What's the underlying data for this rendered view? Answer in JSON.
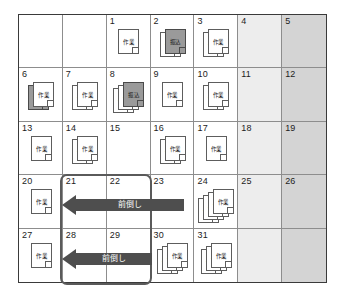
{
  "calendar": {
    "columns": 7,
    "rows": 5,
    "weekend_colors": {
      "saturday": "#ededed",
      "sunday": "#d4d4d4"
    },
    "icon_labels": {
      "work": "作業",
      "transfer": "振込"
    },
    "cells": [
      {
        "day": "",
        "shade": "blank",
        "icons": []
      },
      {
        "day": "",
        "shade": "blank",
        "icons": []
      },
      {
        "day": "1",
        "shade": "none",
        "icons": [
          "work"
        ]
      },
      {
        "day": "2",
        "shade": "none",
        "icons": [
          "work",
          "transfer"
        ]
      },
      {
        "day": "3",
        "shade": "none",
        "icons": [
          "work",
          "work"
        ]
      },
      {
        "day": "4",
        "shade": "sat",
        "icons": []
      },
      {
        "day": "5",
        "shade": "sun",
        "icons": []
      },
      {
        "day": "6",
        "shade": "none",
        "icons": [
          "transfer",
          "work"
        ]
      },
      {
        "day": "7",
        "shade": "none",
        "icons": [
          "work",
          "work"
        ]
      },
      {
        "day": "8",
        "shade": "none",
        "icons": [
          "work",
          "work",
          "transfer"
        ]
      },
      {
        "day": "9",
        "shade": "none",
        "icons": [
          "work"
        ]
      },
      {
        "day": "10",
        "shade": "none",
        "icons": [
          "work",
          "work"
        ]
      },
      {
        "day": "11",
        "shade": "sat",
        "icons": []
      },
      {
        "day": "12",
        "shade": "sun",
        "icons": []
      },
      {
        "day": "13",
        "shade": "none",
        "icons": [
          "work"
        ]
      },
      {
        "day": "14",
        "shade": "none",
        "icons": [
          "work",
          "work"
        ]
      },
      {
        "day": "15",
        "shade": "none",
        "icons": []
      },
      {
        "day": "16",
        "shade": "none",
        "icons": [
          "work",
          "work"
        ]
      },
      {
        "day": "17",
        "shade": "none",
        "icons": [
          "work"
        ]
      },
      {
        "day": "18",
        "shade": "sat",
        "icons": []
      },
      {
        "day": "19",
        "shade": "sun",
        "icons": []
      },
      {
        "day": "20",
        "shade": "none",
        "icons": [
          "work"
        ]
      },
      {
        "day": "21",
        "shade": "none",
        "icons": []
      },
      {
        "day": "22",
        "shade": "none",
        "icons": []
      },
      {
        "day": "23",
        "shade": "none",
        "icons": []
      },
      {
        "day": "24",
        "shade": "none",
        "icons": [
          "work",
          "work",
          "work",
          "work"
        ]
      },
      {
        "day": "25",
        "shade": "sat",
        "icons": []
      },
      {
        "day": "26",
        "shade": "sun",
        "icons": []
      },
      {
        "day": "27",
        "shade": "none",
        "icons": [
          "work"
        ]
      },
      {
        "day": "28",
        "shade": "none",
        "icons": []
      },
      {
        "day": "29",
        "shade": "none",
        "icons": []
      },
      {
        "day": "30",
        "shade": "none",
        "icons": [
          "work",
          "work",
          "work"
        ]
      },
      {
        "day": "31",
        "shade": "none",
        "icons": [
          "work",
          "work",
          "work"
        ]
      },
      {
        "day": "",
        "shade": "sat",
        "icons": []
      },
      {
        "day": "",
        "shade": "sun",
        "icons": []
      }
    ]
  },
  "annotations": {
    "arrows": [
      {
        "label": "前倒し",
        "direction": "left"
      },
      {
        "label": "前倒し",
        "direction": "left"
      }
    ],
    "highlight": {
      "color": "#5a5a5a"
    }
  }
}
